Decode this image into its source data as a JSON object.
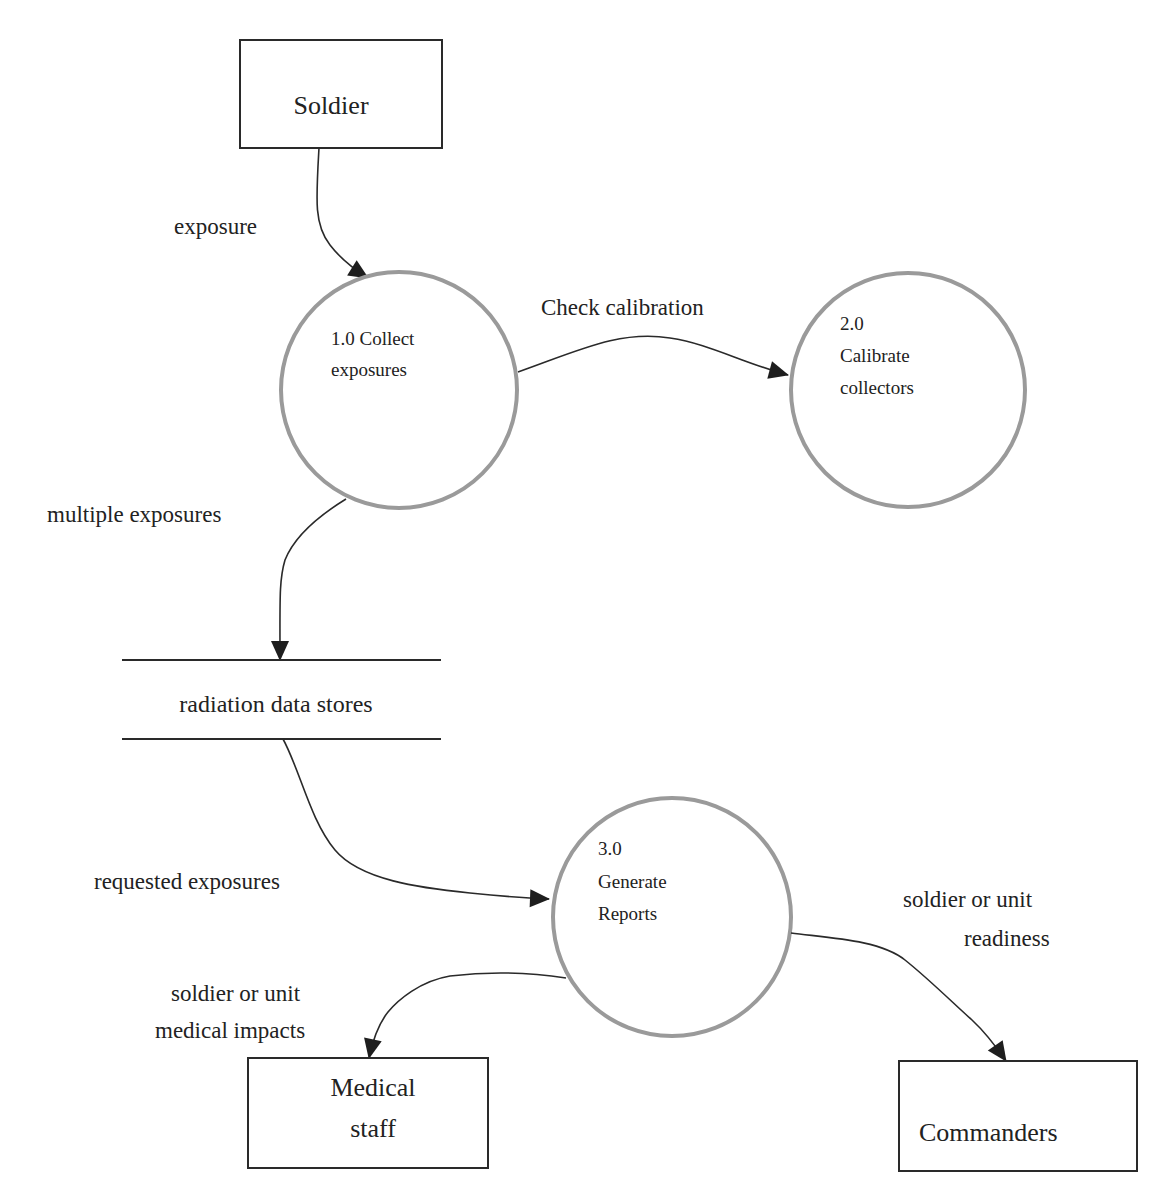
{
  "diagram": {
    "type": "data-flow-diagram",
    "colors": {
      "background": "#ffffff",
      "line": "#2a2a2a",
      "process_circle": "#9a9a9a",
      "text": "#222222"
    },
    "external_entities": [
      {
        "id": "soldier",
        "label": "Soldier"
      },
      {
        "id": "medical",
        "label_line1": "Medical",
        "label_line2": "staff"
      },
      {
        "id": "commanders",
        "label": "Commanders"
      }
    ],
    "processes": [
      {
        "id": "p1",
        "line1": "1.0 Collect",
        "line2": "exposures"
      },
      {
        "id": "p2",
        "line1": "2.0",
        "line2": "Calibrate",
        "line3": "collectors"
      },
      {
        "id": "p3",
        "line1": "3.0",
        "line2": "Generate",
        "line3": "Reports"
      }
    ],
    "data_store": {
      "label": "radiation data stores"
    },
    "flows": [
      {
        "from": "Soldier",
        "to": "1.0 Collect exposures",
        "label": "exposure"
      },
      {
        "from": "1.0 Collect exposures",
        "to": "2.0 Calibrate collectors",
        "label": "Check calibration"
      },
      {
        "from": "1.0 Collect exposures",
        "to": "radiation data stores",
        "label": "multiple exposures"
      },
      {
        "from": "radiation data stores",
        "to": "3.0 Generate Reports",
        "label": "requested exposures"
      },
      {
        "from": "3.0 Generate Reports",
        "to": "Medical staff",
        "label_line1": "soldier or unit",
        "label_line2": "medical impacts"
      },
      {
        "from": "3.0 Generate Reports",
        "to": "Commanders",
        "label_line1": "soldier or unit",
        "label_line2": "readiness"
      }
    ]
  }
}
